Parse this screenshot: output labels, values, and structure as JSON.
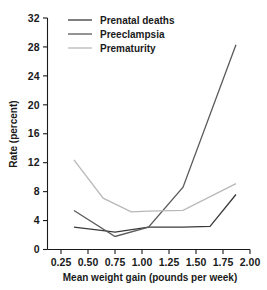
{
  "chart_data": {
    "type": "line",
    "title": "",
    "xlabel": "Mean weight gain (pounds per week)",
    "ylabel": "Rate (percent)",
    "xlim": [
      0.125,
      2.0
    ],
    "ylim": [
      0,
      32
    ],
    "xticks": [
      0.25,
      0.5,
      0.75,
      1.0,
      1.25,
      1.5,
      1.75,
      2.0
    ],
    "xtick_labels": [
      "0.25",
      "0.50",
      "0.75",
      "1.00",
      "1.25",
      "1.50",
      "1.75",
      "2.00"
    ],
    "yticks": [
      0,
      4,
      8,
      12,
      16,
      20,
      24,
      28,
      32
    ],
    "ytick_labels": [
      "0",
      "4",
      "8",
      "12",
      "16",
      "20",
      "24",
      "28",
      "32"
    ],
    "grid": false,
    "legend_position": "top-center",
    "series": [
      {
        "name": "Prenatal deaths",
        "color": "#3a3a3a",
        "x": [
          0.37,
          0.64,
          0.75,
          1.06,
          1.38,
          1.63,
          1.87
        ],
        "y": [
          3.1,
          2.6,
          2.4,
          3.1,
          3.1,
          3.2,
          7.6
        ]
      },
      {
        "name": "Preeclampsia",
        "color": "#5a5a5a",
        "x": [
          0.37,
          0.75,
          1.06,
          1.38,
          1.87
        ],
        "y": [
          5.4,
          1.8,
          3.1,
          8.6,
          28.3
        ]
      },
      {
        "name": "Prematurity",
        "color": "#b8b8b8",
        "x": [
          0.37,
          0.64,
          0.9,
          1.06,
          1.38,
          1.87
        ],
        "y": [
          12.4,
          7.1,
          5.2,
          5.3,
          5.4,
          9.1
        ]
      }
    ]
  },
  "axes": {
    "ylabel": "Rate (percent)",
    "xlabel": "Mean weight gain (pounds per week)"
  },
  "legend": {
    "items": [
      {
        "label": "Prenatal deaths"
      },
      {
        "label": "Preeclampsia"
      },
      {
        "label": "Prematurity"
      }
    ]
  }
}
